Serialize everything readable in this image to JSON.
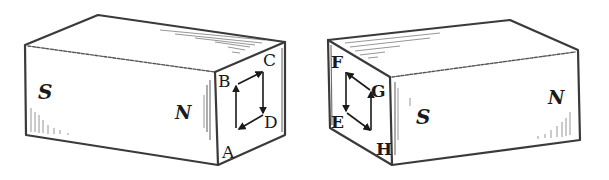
{
  "figure": {
    "colors": {
      "ink": "#1a1a1a",
      "edge": "#3a3a3a",
      "background": "#ffffff"
    },
    "left_magnet": {
      "poles": {
        "left": "S",
        "right": "N"
      },
      "end_face_corners": {
        "bottom_left": "A",
        "top_left": "B",
        "top_right": "C",
        "bottom_right": "D"
      },
      "loop_direction": "A → B → C → D → A"
    },
    "right_magnet": {
      "poles": {
        "left": "S",
        "right": "N"
      },
      "end_face_corners": {
        "top_left": "F",
        "top_right": "G",
        "bottom_left": "E",
        "bottom_right": "H"
      },
      "loop_direction": "F → E → H → G → F"
    }
  }
}
